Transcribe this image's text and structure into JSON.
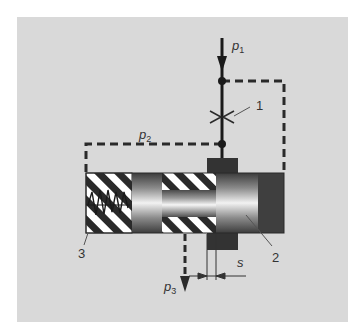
{
  "diagram": {
    "type": "hydraulic-pressure-valve-schematic",
    "background_color": "#d9d9d9",
    "labels": {
      "p1": {
        "base": "p",
        "sub": "1"
      },
      "p2": {
        "base": "p",
        "sub": "2"
      },
      "p3": {
        "base": "p",
        "sub": "3"
      },
      "s": "s",
      "n1": "1",
      "n2": "2",
      "n3": "3"
    },
    "components": [
      {
        "id": "1",
        "name": "restrictor / orifice"
      },
      {
        "id": "2",
        "name": "control piston"
      },
      {
        "id": "3",
        "name": "spring"
      }
    ],
    "colors": {
      "line": "#1a1a1a",
      "dark_block": "#3a3a3a",
      "hatch_dark": "#2a2a2a",
      "hatch_light": "#ffffff",
      "leader": "#555555"
    }
  }
}
